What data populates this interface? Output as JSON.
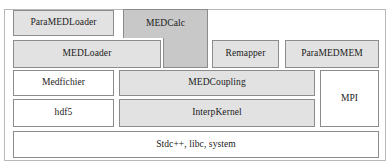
{
  "diagram": {
    "kind": "layered-architecture-stack",
    "colors": {
      "block_light": "#e2e2e2",
      "block_dark": "#c8c8c8",
      "block_white": "#ffffff",
      "block_border": "#8c8c8c",
      "outer_frame_border": "#b9b9b9",
      "text": "#1a1a1a",
      "background": "#ffffff"
    },
    "rows": [
      {
        "index": 1,
        "blocks": [
          {
            "label": "ParaMEDLoader",
            "fill": "block_light"
          },
          {
            "label": "MEDCalc",
            "fill": "block_dark",
            "shape": "stepped-L-spanning-rows-1-2"
          }
        ]
      },
      {
        "index": 2,
        "blocks": [
          {
            "label": "MEDLoader",
            "fill": "block_light"
          },
          {
            "label": "Remapper",
            "fill": "block_light"
          },
          {
            "label": "ParaMEDMEM",
            "fill": "block_light"
          }
        ]
      },
      {
        "index": 3,
        "blocks": [
          {
            "label": "Medfichier",
            "fill": "block_white"
          },
          {
            "label": "MEDCoupling",
            "fill": "block_light"
          },
          {
            "label": "MPI",
            "fill": "block_white",
            "shape": "spanning-rows-3-4"
          }
        ]
      },
      {
        "index": 4,
        "blocks": [
          {
            "label": "hdf5",
            "fill": "block_white"
          },
          {
            "label": "InterpKernel",
            "fill": "block_light"
          }
        ]
      },
      {
        "index": 5,
        "blocks": [
          {
            "label": "Stdc++, libc, system",
            "fill": "block_white"
          }
        ]
      }
    ],
    "labels": {
      "paramedloader": "ParaMEDLoader",
      "medcalc": "MEDCalc",
      "medloader": "MEDLoader",
      "remapper": "Remapper",
      "paramedmem": "ParaMEDMEM",
      "medfichier": "Medfichier",
      "medcoupling": "MEDCoupling",
      "mpi": "MPI",
      "hdf5": "hdf5",
      "interpkernel": "InterpKernel",
      "base": "Stdc++, libc, system"
    }
  }
}
